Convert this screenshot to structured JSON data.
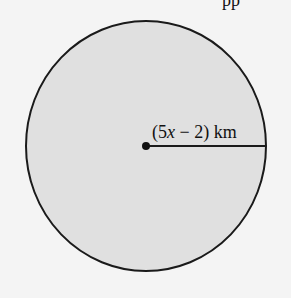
{
  "diagram": {
    "shape": "circle",
    "radius_label": {
      "open": "(5",
      "var": "x",
      "rest": " − 2) km"
    },
    "fill_color": "#e0e0e0",
    "stroke_color": "#1a1a1a",
    "background": "#f4f4f4",
    "top_text_fragment": "pp"
  }
}
